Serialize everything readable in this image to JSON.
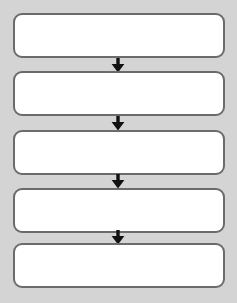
{
  "diagram": {
    "type": "vertical-flowchart",
    "title": "",
    "canvas": {
      "width": 237,
      "height": 303
    },
    "colors": {
      "background": "#d4d4d4",
      "node_fill": "#ffffff",
      "node_border": "#6b6b6b",
      "arrow": "#111111"
    },
    "nodes": [
      {
        "id": "node-1",
        "label": "",
        "x": 13,
        "y": 13,
        "width": 212,
        "height": 45
      },
      {
        "id": "node-2",
        "label": "",
        "x": 13,
        "y": 71,
        "width": 212,
        "height": 45
      },
      {
        "id": "node-3",
        "label": "",
        "x": 13,
        "y": 130,
        "width": 212,
        "height": 45
      },
      {
        "id": "node-4",
        "label": "",
        "x": 13,
        "y": 188,
        "width": 212,
        "height": 45
      },
      {
        "id": "node-5",
        "label": "",
        "x": 13,
        "y": 243,
        "width": 212,
        "height": 45
      }
    ],
    "connectors": [
      {
        "id": "arrow-1",
        "from": "node-1",
        "to": "node-2",
        "icon": "arrow-down-icon",
        "x": 109,
        "y": 58
      },
      {
        "id": "arrow-2",
        "from": "node-2",
        "to": "node-3",
        "icon": "arrow-down-icon",
        "x": 109,
        "y": 116
      },
      {
        "id": "arrow-3",
        "from": "node-3",
        "to": "node-4",
        "icon": "arrow-down-icon",
        "x": 109,
        "y": 174
      },
      {
        "id": "arrow-4",
        "from": "node-4",
        "to": "node-5",
        "icon": "arrow-down-icon",
        "x": 109,
        "y": 230
      }
    ]
  }
}
